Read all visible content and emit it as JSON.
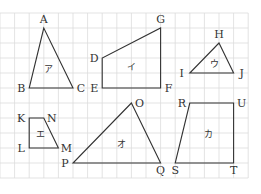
{
  "diagram": {
    "title": "",
    "grid": {
      "columns": 17,
      "rows": 11
    },
    "shapes": [
      {
        "id": "ア",
        "label": "ア",
        "kind": "triangle",
        "vertices": [
          {
            "name": "A",
            "col": 3,
            "row": 1,
            "label_pos": "top"
          },
          {
            "name": "B",
            "col": 2,
            "row": 5,
            "label_pos": "left"
          },
          {
            "name": "C",
            "col": 5,
            "row": 5,
            "label_pos": "right"
          }
        ]
      },
      {
        "id": "イ",
        "label": "イ",
        "kind": "quadrilateral",
        "vertices": [
          {
            "name": "D",
            "col": 7,
            "row": 3,
            "label_pos": "left"
          },
          {
            "name": "E",
            "col": 7,
            "row": 5,
            "label_pos": "left"
          },
          {
            "name": "F",
            "col": 11,
            "row": 5,
            "label_pos": "right"
          },
          {
            "name": "G",
            "col": 11,
            "row": 1,
            "label_pos": "top"
          }
        ]
      },
      {
        "id": "ウ",
        "label": "ウ",
        "kind": "triangle",
        "vertices": [
          {
            "name": "H",
            "col": 15,
            "row": 2,
            "label_pos": "top"
          },
          {
            "name": "I",
            "col": 13,
            "row": 4,
            "label_pos": "left"
          },
          {
            "name": "J",
            "col": 16,
            "row": 4,
            "label_pos": "right"
          }
        ]
      },
      {
        "id": "エ",
        "label": "エ",
        "kind": "quadrilateral",
        "vertices": [
          {
            "name": "K",
            "col": 2,
            "row": 7,
            "label_pos": "left"
          },
          {
            "name": "L",
            "col": 2,
            "row": 9,
            "label_pos": "left"
          },
          {
            "name": "M",
            "col": 4,
            "row": 9,
            "label_pos": "right"
          },
          {
            "name": "N",
            "col": 3,
            "row": 7,
            "label_pos": "right"
          }
        ]
      },
      {
        "id": "オ",
        "label": "オ",
        "kind": "triangle",
        "vertices": [
          {
            "name": "O",
            "col": 9,
            "row": 6,
            "label_pos": "right"
          },
          {
            "name": "P",
            "col": 5,
            "row": 10,
            "label_pos": "left"
          },
          {
            "name": "Q",
            "col": 11,
            "row": 10,
            "label_pos": "bottom"
          }
        ]
      },
      {
        "id": "カ",
        "label": "カ",
        "kind": "quadrilateral",
        "vertices": [
          {
            "name": "R",
            "col": 13,
            "row": 6,
            "label_pos": "left"
          },
          {
            "name": "S",
            "col": 12,
            "row": 10,
            "label_pos": "bottom"
          },
          {
            "name": "T",
            "col": 16,
            "row": 10,
            "label_pos": "bottom"
          },
          {
            "name": "U",
            "col": 16,
            "row": 6,
            "label_pos": "right"
          }
        ]
      }
    ]
  }
}
